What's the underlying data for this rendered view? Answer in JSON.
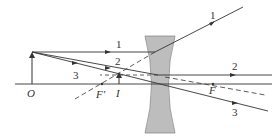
{
  "diagram": {
    "type": "optics-ray-diagram",
    "lens": "concave (diverging) lens",
    "colors": {
      "line": "#333333",
      "lens_fill": "#bdbdbd",
      "lens_stroke": "#8a8a8a",
      "background": "#ffffff"
    },
    "labels": {
      "object": "O",
      "image": "I",
      "focal_left": "F'",
      "focal_right": "F",
      "ray1_left": "1",
      "ray1_right": "1",
      "ray2_left": "2",
      "ray2_right": "2",
      "ray3_left": "3",
      "ray3_right": "3"
    }
  }
}
